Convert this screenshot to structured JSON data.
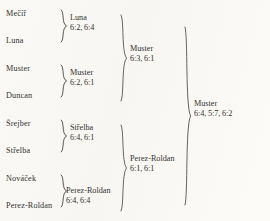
{
  "document": {
    "type": "tennis-tournament-bracket",
    "rounds": 4,
    "player_count": 8
  },
  "round1": {
    "label": "Round 1",
    "players": [
      {
        "name": "Mečíř"
      },
      {
        "name": "Luna"
      },
      {
        "name": "Muster"
      },
      {
        "name": "Duncan"
      },
      {
        "name": "Šrejber"
      },
      {
        "name": "Střelba"
      },
      {
        "name": "Nováček"
      },
      {
        "name": "Perez-Roldan"
      }
    ]
  },
  "round2": {
    "label": "Quarterfinals",
    "matches": [
      {
        "winner": "Luna",
        "score": "6:2, 6:4"
      },
      {
        "winner": "Muster",
        "score": "6:2, 6:1"
      },
      {
        "winner": "Střelba",
        "score": "6:4, 6:1"
      },
      {
        "winner": "Perez-Roldan",
        "score": "6:4, 6:4"
      }
    ]
  },
  "round3": {
    "label": "Semifinals",
    "matches": [
      {
        "winner": "Muster",
        "score": "6:3, 6:1"
      },
      {
        "winner": "Perez-Roldan",
        "score": "6:1, 6:1"
      }
    ]
  },
  "round4": {
    "label": "Final",
    "matches": [
      {
        "winner": "Muster",
        "score": "6:4, 5:7, 6:2"
      }
    ]
  },
  "colors": {
    "paper": "#fbfaf7",
    "ink": "#343230",
    "stroke": "#46443f"
  }
}
